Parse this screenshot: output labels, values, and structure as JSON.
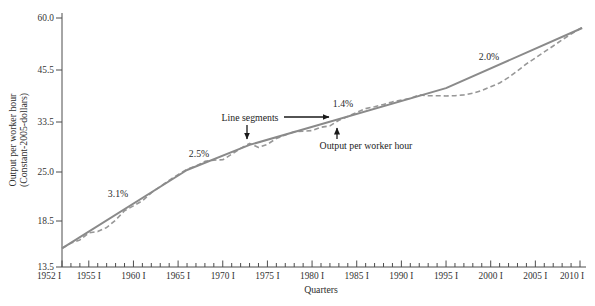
{
  "figure": {
    "y_axis_title_line1": "Output per worker hour",
    "y_axis_title_line2": "(Constant-2005-dollars)",
    "x_axis_title": "Quarters"
  },
  "colors": {
    "background": "#ffffff",
    "axis": "#4d4d4d",
    "solid_line": "#8a8a8a",
    "dashed_line": "#979797",
    "annotation_text": "#222222",
    "arrow": "#1a1a1a"
  },
  "chart_data": {
    "type": "line",
    "y_scale": "log",
    "x_range_years": [
      1952,
      2010.6
    ],
    "y_axis": {
      "ticks": [
        {
          "label": "13.5",
          "value": 13.5,
          "px": 267
        },
        {
          "label": "18.5",
          "value": 18.5,
          "px": 221
        },
        {
          "label": "25.0",
          "value": 25.0,
          "px": 172
        },
        {
          "label": "33.5",
          "value": 33.5,
          "px": 122
        },
        {
          "label": "45.5",
          "value": 45.5,
          "px": 70
        },
        {
          "label": "60.0",
          "value": 60.0,
          "px": 18
        }
      ]
    },
    "x_axis": {
      "major_ticks": [
        {
          "label": "1952 I",
          "year": 1952
        },
        {
          "label": "1955 I",
          "year": 1955
        },
        {
          "label": "1960 I",
          "year": 1960
        },
        {
          "label": "1965 I",
          "year": 1965
        },
        {
          "label": "1970 I",
          "year": 1970
        },
        {
          "label": "1975 I",
          "year": 1975
        },
        {
          "label": "1980 I",
          "year": 1980
        },
        {
          "label": "1985 I",
          "year": 1985
        },
        {
          "label": "1990 I",
          "year": 1990
        },
        {
          "label": "1995 I",
          "year": 1995
        },
        {
          "label": "2000 I",
          "year": 2000
        },
        {
          "label": "2005 I",
          "year": 2005
        },
        {
          "label": "2010 I",
          "year": 2010
        }
      ],
      "minor_tick_step_years": 1
    },
    "series": [
      {
        "name": "Output per worker hour",
        "style": "dashed",
        "points": [
          [
            1952,
            15.35
          ],
          [
            1953,
            15.9
          ],
          [
            1954,
            16.25
          ],
          [
            1955,
            17.05
          ],
          [
            1956,
            17.2
          ],
          [
            1957,
            17.7
          ],
          [
            1958,
            18.6
          ],
          [
            1959,
            19.7
          ],
          [
            1960,
            20.3
          ],
          [
            1961,
            20.95
          ],
          [
            1962,
            22.0
          ],
          [
            1963,
            22.85
          ],
          [
            1964,
            23.75
          ],
          [
            1965,
            24.6
          ],
          [
            1966,
            25.4
          ],
          [
            1967,
            25.9
          ],
          [
            1968,
            26.6
          ],
          [
            1969,
            26.8
          ],
          [
            1970,
            26.85
          ],
          [
            1971,
            27.75
          ],
          [
            1972,
            28.7
          ],
          [
            1973,
            29.55
          ],
          [
            1974,
            28.85
          ],
          [
            1975,
            29.4
          ],
          [
            1976,
            30.4
          ],
          [
            1977,
            31.05
          ],
          [
            1978,
            31.65
          ],
          [
            1979,
            31.75
          ],
          [
            1980,
            31.85
          ],
          [
            1981,
            32.5
          ],
          [
            1982,
            32.75
          ],
          [
            1983,
            33.85
          ],
          [
            1984,
            34.6
          ],
          [
            1985,
            35.45
          ],
          [
            1986,
            36.25
          ],
          [
            1987,
            36.65
          ],
          [
            1988,
            37.15
          ],
          [
            1989,
            37.7
          ],
          [
            1990,
            38.1
          ],
          [
            1991,
            38.5
          ],
          [
            1992,
            39.3
          ],
          [
            1993,
            39.1
          ],
          [
            1994,
            39.1
          ],
          [
            1995,
            39.05
          ],
          [
            1996,
            39.1
          ],
          [
            1997,
            39.3
          ],
          [
            1998,
            39.7
          ],
          [
            1999,
            40.35
          ],
          [
            2000,
            41.25
          ],
          [
            2001,
            42.15
          ],
          [
            2002,
            43.55
          ],
          [
            2003,
            45.25
          ],
          [
            2004,
            47.0
          ],
          [
            2005,
            48.5
          ],
          [
            2006,
            50.1
          ],
          [
            2007,
            51.7
          ],
          [
            2008,
            53.4
          ],
          [
            2009,
            55.1
          ],
          [
            2010.25,
            57.1
          ]
        ]
      },
      {
        "name": "Line segments (trend)",
        "style": "solid",
        "points": [
          [
            1952,
            15.35
          ],
          [
            1966,
            25.3
          ],
          [
            1973,
            29.3
          ],
          [
            1995,
            40.9
          ],
          [
            2010.25,
            56.9
          ]
        ]
      }
    ],
    "growth_rate_labels": [
      {
        "text": "3.1%",
        "x": 118,
        "y": 197
      },
      {
        "text": "2.5%",
        "x": 199,
        "y": 157
      },
      {
        "text": "1.4%",
        "x": 343,
        "y": 107
      },
      {
        "text": "2.0%",
        "x": 489,
        "y": 60
      }
    ],
    "callouts": [
      {
        "text": "Line segments",
        "text_x": 250,
        "text_y": 121,
        "arrows": [
          {
            "x1": 247,
            "y1": 125,
            "x2": 247,
            "y2": 139
          },
          {
            "x1": 284,
            "y1": 117,
            "x2": 329,
            "y2": 117
          }
        ]
      },
      {
        "text": "Output per worker hour",
        "text_x": 366,
        "text_y": 149,
        "arrows": [
          {
            "x1": 337,
            "y1": 139,
            "x2": 337,
            "y2": 128
          }
        ]
      }
    ]
  }
}
